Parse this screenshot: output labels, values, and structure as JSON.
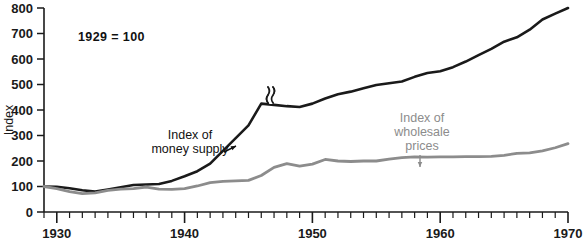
{
  "chart_data": {
    "type": "line",
    "title": "",
    "subtitle": "",
    "note": "1929 = 100",
    "xlabel": "",
    "ylabel": "Index",
    "xlim": [
      1929,
      1970
    ],
    "ylim": [
      0,
      800
    ],
    "grid": false,
    "legend_position": "inline-annotations",
    "y_ticks": [
      0,
      100,
      200,
      300,
      400,
      500,
      600,
      700,
      800
    ],
    "y_tick_labels": [
      "0",
      "100",
      "200",
      "300",
      "400",
      "500",
      "600",
      "700",
      "800"
    ],
    "x_ticks": [
      1930,
      1940,
      1950,
      1960,
      1970
    ],
    "x_tick_labels": [
      "1930",
      "1940",
      "1950",
      "1960",
      "1970"
    ],
    "x_minor_tick_step": 1,
    "annotations": [
      {
        "id": "money-supply",
        "text_lines": [
          "Index of",
          "money supply"
        ],
        "color": "#111111",
        "text_x": 190,
        "text_y": 139,
        "arrow_from": [
          224,
          152
        ],
        "arrow_to": [
          236,
          146
        ]
      },
      {
        "id": "wholesale-prices",
        "text_lines": [
          "Index of",
          "wholesale",
          "prices"
        ],
        "color": "#8c8c8c",
        "text_x": 422,
        "text_y": 122,
        "arrow_from": [
          420,
          155
        ],
        "arrow_to": [
          420,
          167
        ]
      }
    ],
    "break_marker": {
      "label": "series break",
      "x": 268,
      "y": 95
    },
    "series": [
      {
        "name": "Index of money supply",
        "color": "#1a1a1a",
        "width": 2.6,
        "x": [
          1929,
          1930,
          1931,
          1932,
          1933,
          1934,
          1935,
          1936,
          1937,
          1938,
          1939,
          1940,
          1941,
          1942,
          1943,
          1944,
          1945,
          1946,
          1947,
          1948,
          1949,
          1950,
          1951,
          1952,
          1953,
          1954,
          1955,
          1956,
          1957,
          1958,
          1959,
          1960,
          1961,
          1962,
          1963,
          1964,
          1965,
          1966,
          1967,
          1968,
          1969,
          1970
        ],
        "values": [
          100,
          99,
          93,
          85,
          80,
          88,
          97,
          106,
          108,
          110,
          122,
          140,
          160,
          190,
          240,
          290,
          340,
          425,
          420,
          415,
          412,
          425,
          445,
          462,
          472,
          485,
          498,
          505,
          512,
          530,
          545,
          552,
          568,
          590,
          615,
          640,
          668,
          685,
          715,
          755,
          778,
          800
        ]
      },
      {
        "name": "Index of wholesale prices",
        "color": "#8c8c8c",
        "width": 2.8,
        "x": [
          1929,
          1930,
          1931,
          1932,
          1933,
          1934,
          1935,
          1936,
          1937,
          1938,
          1939,
          1940,
          1941,
          1942,
          1943,
          1944,
          1945,
          1946,
          1947,
          1948,
          1949,
          1950,
          1951,
          1952,
          1953,
          1954,
          1955,
          1956,
          1957,
          1958,
          1959,
          1960,
          1961,
          1962,
          1963,
          1964,
          1965,
          1966,
          1967,
          1968,
          1969,
          1970
        ],
        "values": [
          100,
          92,
          80,
          72,
          75,
          85,
          90,
          92,
          98,
          90,
          89,
          92,
          102,
          115,
          120,
          122,
          124,
          143,
          175,
          190,
          180,
          188,
          206,
          200,
          198,
          200,
          200,
          207,
          213,
          216,
          215,
          216,
          216,
          217,
          217,
          218,
          222,
          230,
          232,
          240,
          252,
          268
        ]
      }
    ]
  },
  "axis": {
    "y_title": "Index"
  }
}
